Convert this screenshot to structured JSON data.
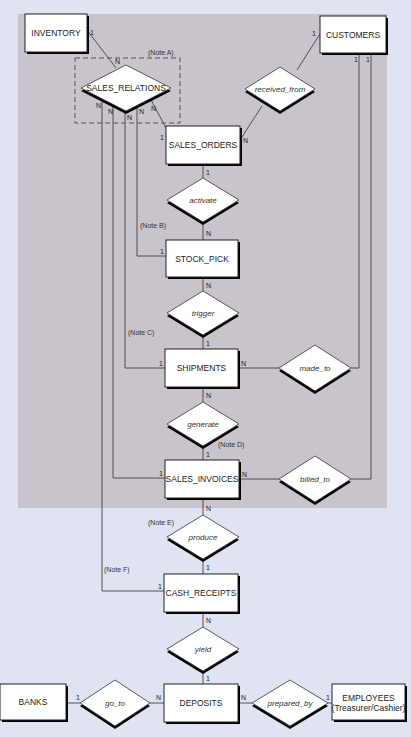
{
  "colors": {
    "page_bg": "#dfe3f2",
    "shaded_region": "#c9c3cc",
    "entity_fill": "#ffffff",
    "line": "#444444",
    "shadow": "#000000"
  },
  "shaded_region": {
    "x": 18,
    "y": 14,
    "w": 369,
    "h": 494
  },
  "dashed_group": {
    "x": 75,
    "y": 58,
    "w": 105,
    "h": 65,
    "note": "(Note A)",
    "note_x": 148,
    "note_y": 55
  },
  "entities": [
    {
      "id": "inventory",
      "label": "INVENTORY",
      "x": 25,
      "y": 14,
      "w": 62,
      "h": 38
    },
    {
      "id": "customers",
      "label": "CUSTOMERS",
      "x": 320,
      "y": 16,
      "w": 66,
      "h": 37
    },
    {
      "id": "sales_orders",
      "label": "SALES_ORDERS",
      "x": 166,
      "y": 126,
      "w": 74,
      "h": 38
    },
    {
      "id": "stock_pick",
      "label": "STOCK_PICK",
      "x": 166,
      "y": 240,
      "w": 72,
      "h": 37
    },
    {
      "id": "shipments",
      "label": "SHIPMENTS",
      "x": 165,
      "y": 349,
      "w": 73,
      "h": 38
    },
    {
      "id": "sales_invoices",
      "label": "SALES_INVOICES",
      "x": 165,
      "y": 460,
      "w": 74,
      "h": 38
    },
    {
      "id": "cash_receipts",
      "label": "CASH_RECEIPTS",
      "x": 164,
      "y": 574,
      "w": 74,
      "h": 38
    },
    {
      "id": "deposits",
      "label": "DEPOSITS",
      "x": 164,
      "y": 684,
      "w": 74,
      "h": 38
    },
    {
      "id": "banks",
      "label": "BANKS",
      "x": 0,
      "y": 684,
      "w": 66,
      "h": 36
    },
    {
      "id": "employees",
      "label": "EMPLOYEES",
      "sublabel": "(Treasurer/Cashier)",
      "x": 332,
      "y": 684,
      "w": 73,
      "h": 36
    }
  ],
  "relationships": [
    {
      "id": "sales_relations",
      "label": "SALES_RELATIONS",
      "cx": 126,
      "cy": 88,
      "hw": 45,
      "hh": 23,
      "italic": false
    },
    {
      "id": "received_from",
      "label": "received_from",
      "cx": 280,
      "cy": 89,
      "hw": 35,
      "hh": 22,
      "italic": true
    },
    {
      "id": "activate",
      "label": "activate",
      "cx": 203,
      "cy": 200,
      "hw": 36,
      "hh": 22,
      "italic": true
    },
    {
      "id": "trigger",
      "label": "trigger",
      "cx": 203,
      "cy": 313,
      "hw": 36,
      "hh": 22,
      "italic": true
    },
    {
      "id": "made_to",
      "label": "made_to",
      "cx": 315,
      "cy": 368,
      "hw": 36,
      "hh": 23,
      "italic": true
    },
    {
      "id": "generate",
      "label": "generate",
      "cx": 203,
      "cy": 424,
      "hw": 36,
      "hh": 22,
      "italic": true
    },
    {
      "id": "billed_to",
      "label": "billed_to",
      "cx": 315,
      "cy": 479,
      "hw": 36,
      "hh": 23,
      "italic": true
    },
    {
      "id": "produce",
      "label": "produce",
      "cx": 203,
      "cy": 537,
      "hw": 36,
      "hh": 22,
      "italic": true
    },
    {
      "id": "yield",
      "label": "yield",
      "cx": 203,
      "cy": 649,
      "hw": 36,
      "hh": 22,
      "italic": true
    },
    {
      "id": "go_to",
      "label": "go_to",
      "cx": 115,
      "cy": 703,
      "hw": 35,
      "hh": 23,
      "italic": true
    },
    {
      "id": "prepared_by",
      "label": "prepared_by",
      "cx": 290,
      "cy": 703,
      "hw": 38,
      "hh": 23,
      "italic": true
    }
  ],
  "connections": [
    {
      "points": [
        [
          87,
          30
        ],
        [
          116,
          68
        ]
      ],
      "labels": [
        {
          "t": "1",
          "x": 90,
          "y": 35
        },
        {
          "t": "N",
          "x": 115,
          "y": 64
        }
      ]
    },
    {
      "points": [
        [
          150,
          98
        ],
        [
          166,
          128
        ]
      ],
      "labels": [
        {
          "t": "N",
          "x": 151,
          "y": 111
        },
        {
          "t": "1",
          "x": 160,
          "y": 140
        }
      ]
    },
    {
      "points": [
        [
          320,
          34
        ],
        [
          297,
          70
        ]
      ],
      "labels": [
        {
          "t": "1",
          "x": 312,
          "y": 36
        }
      ]
    },
    {
      "points": [
        [
          262,
          106
        ],
        [
          240,
          140
        ]
      ],
      "labels": [
        {
          "t": "N",
          "x": 243,
          "y": 143
        }
      ]
    },
    {
      "points": [
        [
          203,
          164
        ],
        [
          203,
          178
        ]
      ],
      "labels": [
        {
          "t": "1",
          "x": 206,
          "y": 175
        }
      ]
    },
    {
      "points": [
        [
          203,
          222
        ],
        [
          203,
          240
        ]
      ],
      "labels": [
        {
          "t": "N",
          "x": 206,
          "y": 236
        }
      ]
    },
    {
      "points": [
        [
          203,
          277
        ],
        [
          203,
          291
        ]
      ],
      "labels": [
        {
          "t": "N",
          "x": 206,
          "y": 288
        }
      ]
    },
    {
      "points": [
        [
          203,
          335
        ],
        [
          203,
          349
        ]
      ],
      "labels": [
        {
          "t": "1",
          "x": 206,
          "y": 346
        }
      ]
    },
    {
      "points": [
        [
          203,
          387
        ],
        [
          203,
          402
        ]
      ],
      "labels": [
        {
          "t": "N",
          "x": 206,
          "y": 398
        }
      ]
    },
    {
      "points": [
        [
          203,
          446
        ],
        [
          203,
          460
        ]
      ],
      "labels": [
        {
          "t": "1",
          "x": 206,
          "y": 457
        }
      ]
    },
    {
      "points": [
        [
          203,
          498
        ],
        [
          203,
          515
        ]
      ],
      "labels": [
        {
          "t": "N",
          "x": 206,
          "y": 511
        }
      ]
    },
    {
      "points": [
        [
          203,
          559
        ],
        [
          203,
          574
        ]
      ],
      "labels": [
        {
          "t": "1",
          "x": 206,
          "y": 570
        }
      ]
    },
    {
      "points": [
        [
          203,
          612
        ],
        [
          203,
          627
        ]
      ],
      "labels": [
        {
          "t": "N",
          "x": 206,
          "y": 623
        }
      ]
    },
    {
      "points": [
        [
          203,
          671
        ],
        [
          203,
          684
        ]
      ],
      "labels": [
        {
          "t": "1",
          "x": 206,
          "y": 681
        }
      ]
    },
    {
      "points": [
        [
          238,
          368
        ],
        [
          279,
          368
        ]
      ],
      "labels": [
        {
          "t": "N",
          "x": 241,
          "y": 366
        }
      ]
    },
    {
      "points": [
        [
          351,
          368
        ],
        [
          359,
          368
        ],
        [
          359,
          53
        ]
      ],
      "labels": [
        {
          "t": "1",
          "x": 354,
          "y": 62
        }
      ]
    },
    {
      "points": [
        [
          239,
          479
        ],
        [
          279,
          479
        ]
      ],
      "labels": [
        {
          "t": "N",
          "x": 242,
          "y": 477
        }
      ]
    },
    {
      "points": [
        [
          351,
          479
        ],
        [
          371,
          479
        ],
        [
          371,
          53
        ]
      ],
      "labels": [
        {
          "t": "1",
          "x": 366,
          "y": 62
        }
      ]
    },
    {
      "points": [
        [
          137,
          104
        ],
        [
          137,
          256
        ],
        [
          166,
          256
        ]
      ],
      "labels": [
        {
          "t": "N",
          "x": 139,
          "y": 114
        },
        {
          "t": "1",
          "x": 160,
          "y": 254
        }
      ]
    },
    {
      "points": [
        [
          125,
          110
        ],
        [
          125,
          368
        ],
        [
          165,
          368
        ]
      ],
      "labels": [
        {
          "t": "N",
          "x": 127,
          "y": 120
        },
        {
          "t": "1",
          "x": 159,
          "y": 366
        }
      ]
    },
    {
      "points": [
        [
          113,
          104
        ],
        [
          113,
          478
        ],
        [
          165,
          478
        ]
      ],
      "labels": [
        {
          "t": "N",
          "x": 108,
          "y": 114
        },
        {
          "t": "1",
          "x": 159,
          "y": 476
        }
      ]
    },
    {
      "points": [
        [
          102,
          98
        ],
        [
          102,
          591
        ],
        [
          164,
          591
        ]
      ],
      "labels": [
        {
          "t": "N",
          "x": 96,
          "y": 108
        },
        {
          "t": "1",
          "x": 158,
          "y": 589
        }
      ]
    },
    {
      "points": [
        [
          66,
          703
        ],
        [
          80,
          703
        ]
      ],
      "labels": [
        {
          "t": "1",
          "x": 76,
          "y": 700
        }
      ]
    },
    {
      "points": [
        [
          150,
          703
        ],
        [
          164,
          703
        ]
      ],
      "labels": [
        {
          "t": "N",
          "x": 156,
          "y": 700
        }
      ]
    },
    {
      "points": [
        [
          238,
          703
        ],
        [
          252,
          703
        ]
      ],
      "labels": [
        {
          "t": "N",
          "x": 241,
          "y": 700
        }
      ]
    },
    {
      "points": [
        [
          328,
          703
        ],
        [
          332,
          703
        ]
      ],
      "labels": [
        {
          "t": "1",
          "x": 326,
          "y": 700
        }
      ]
    }
  ],
  "notes": [
    {
      "label": "(Note B)",
      "x": 140,
      "y": 228
    },
    {
      "label": "(Note C)",
      "x": 128,
      "y": 335
    },
    {
      "label": "(Note D)",
      "x": 218,
      "y": 447
    },
    {
      "label": "(Note E)",
      "x": 148,
      "y": 525
    },
    {
      "label": "(Note F)",
      "x": 104,
      "y": 572
    }
  ]
}
